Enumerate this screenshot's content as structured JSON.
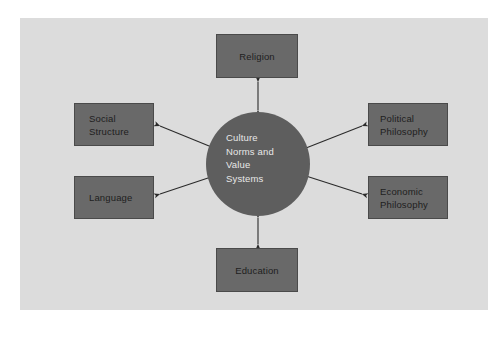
{
  "diagram": {
    "type": "hub-and-spoke",
    "panel_background": "#dcdcdc",
    "page_background": "#ffffff",
    "node_fill": "#696969",
    "node_border": "#4a4a4a",
    "node_text_color": "#1e1e1e",
    "hub_fill": "#5e5e5e",
    "hub_text_color": "#e8e8e8",
    "arrow_color": "#2b2b2b",
    "hub": {
      "name": "culture-norms-and-value-systems",
      "label": "Culture\nNorms and\nValue\nSystems",
      "shape": "circle",
      "center_x": 258,
      "center_y": 164,
      "radius": 52
    },
    "nodes": [
      {
        "name": "religion",
        "label": "Religion",
        "position": "top",
        "connector": "double-arrow"
      },
      {
        "name": "social-structure",
        "label": "Social\nStructure",
        "position": "upper-left",
        "connector": "double-arrow"
      },
      {
        "name": "language",
        "label": "Language",
        "position": "lower-left",
        "connector": "double-arrow"
      },
      {
        "name": "political-philosophy",
        "label": "Political\nPhilosophy",
        "position": "upper-right",
        "connector": "double-arrow"
      },
      {
        "name": "economic-philosophy",
        "label": "Economic\nPhilosophy",
        "position": "lower-right",
        "connector": "double-arrow"
      },
      {
        "name": "education",
        "label": "Education",
        "position": "bottom",
        "connector": "double-arrow"
      }
    ]
  }
}
